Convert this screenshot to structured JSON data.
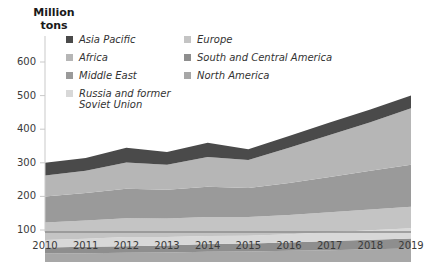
{
  "axis": {
    "y_title": "Million\ntons",
    "y_ticks": [
      "100",
      "200",
      "300",
      "400",
      "500",
      "600"
    ],
    "x_ticks": [
      "2010",
      "2011",
      "2012",
      "2013",
      "2014",
      "2015",
      "2016",
      "2017",
      "2018",
      "2019"
    ]
  },
  "legend": {
    "left": [
      {
        "label": "Asia Pacific",
        "color": "#4a4a4a"
      },
      {
        "label": "Africa",
        "color": "#b6b6b6"
      },
      {
        "label": "Middle East",
        "color": "#9a9a9a"
      },
      {
        "label": "Russia and former\nSoviet Union",
        "color": "#d8d8d8"
      }
    ],
    "right": [
      {
        "label": "Europe",
        "color": "#c4c4c4"
      },
      {
        "label": "South and Central America",
        "color": "#8e8e8e"
      },
      {
        "label": "North America",
        "color": "#a7a7a7"
      }
    ]
  },
  "chart_data": {
    "type": "area",
    "stacked": true,
    "title": "",
    "xlabel": "",
    "ylabel": "Million tons",
    "ylim": [
      0,
      650
    ],
    "grid": false,
    "legend_position": "top",
    "categories": [
      "2010",
      "2011",
      "2012",
      "2013",
      "2014",
      "2015",
      "2016",
      "2017",
      "2018",
      "2019"
    ],
    "series": [
      {
        "name": "North America",
        "color": "#a7a7a7",
        "values": [
          30,
          31,
          32,
          33,
          35,
          36,
          38,
          40,
          43,
          45
        ]
      },
      {
        "name": "South and Central America",
        "color": "#8e8e8e",
        "values": [
          18,
          19,
          20,
          21,
          23,
          24,
          25,
          27,
          28,
          30
        ]
      },
      {
        "name": "Russia and former Soviet Union",
        "color": "#d8d8d8",
        "values": [
          22,
          24,
          27,
          25,
          24,
          23,
          24,
          26,
          28,
          30
        ]
      },
      {
        "name": "Europe",
        "color": "#c4c4c4",
        "values": [
          52,
          54,
          56,
          55,
          57,
          56,
          58,
          60,
          62,
          64
        ]
      },
      {
        "name": "Middle East",
        "color": "#9a9a9a",
        "values": [
          78,
          82,
          88,
          86,
          90,
          86,
          95,
          105,
          115,
          125
        ]
      },
      {
        "name": "Africa",
        "color": "#b6b6b6",
        "values": [
          62,
          66,
          78,
          74,
          88,
          83,
          105,
          125,
          145,
          168
        ]
      },
      {
        "name": "Asia Pacific",
        "color": "#4a4a4a",
        "values": [
          38,
          38,
          44,
          38,
          43,
          32,
          35,
          37,
          38,
          38
        ]
      }
    ],
    "totals": [
      300,
      314,
      345,
      332,
      360,
      340,
      380,
      420,
      459,
      500
    ]
  }
}
